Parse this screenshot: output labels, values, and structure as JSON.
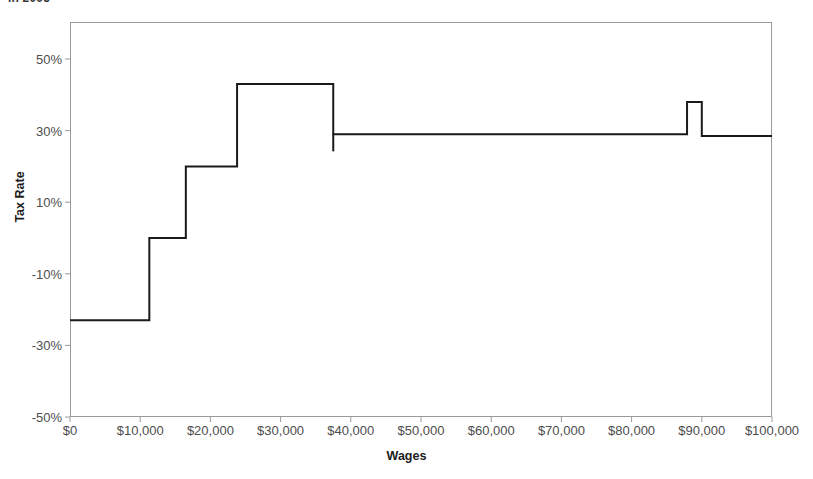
{
  "chart_data": {
    "type": "line",
    "title": "in 2005",
    "xlabel": "Wages",
    "ylabel": "Tax Rate",
    "xlim": [
      0,
      100000
    ],
    "ylim": [
      -50,
      50
    ],
    "grid": false,
    "legend": "none",
    "x_ticks": [
      0,
      10000,
      20000,
      30000,
      40000,
      50000,
      60000,
      70000,
      80000,
      90000,
      100000
    ],
    "x_tick_labels": [
      "$0",
      "$10,000",
      "$20,000",
      "$30,000",
      "$40,000",
      "$50,000",
      "$60,000",
      "$70,000",
      "$80,000",
      "$90,000",
      "$100,000"
    ],
    "y_ticks": [
      50,
      30,
      10,
      -10,
      -30,
      -50
    ],
    "y_tick_labels": [
      "50%",
      "30%",
      "10%",
      "-10%",
      "-30%",
      "-50%"
    ],
    "series": [
      {
        "name": "Effective marginal tax rate",
        "style": "step",
        "color": "#1a1a1a",
        "line_width": 2,
        "steps": [
          {
            "x_start": 0,
            "x_end": 11300,
            "y": -23
          },
          {
            "x_start": 11300,
            "x_end": 16500,
            "y": 0
          },
          {
            "x_start": 16500,
            "x_end": 23800,
            "y": 20
          },
          {
            "x_start": 23800,
            "x_end": 37500,
            "y": 43
          },
          {
            "x_start": 37500,
            "x_end": 87900,
            "y": 29
          },
          {
            "x_start": 87900,
            "x_end": 90000,
            "y": 38
          },
          {
            "x_start": 90000,
            "x_end": 100000,
            "y": 28.5
          }
        ],
        "overshoot_note": "vertical drop at $37,500 extends slightly below the 29% plateau"
      }
    ]
  },
  "axes": {
    "y_title": "Tax Rate",
    "x_title": "Wages"
  }
}
